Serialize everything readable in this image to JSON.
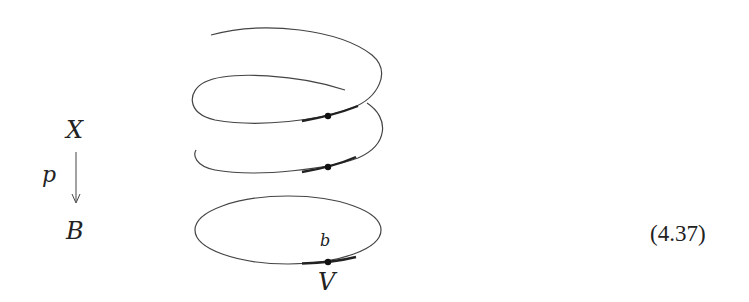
{
  "diagram": {
    "type": "covering-space-helix",
    "labels": {
      "total_space": "X",
      "projection": "p",
      "base_space": "B",
      "basepoint": "b",
      "neighborhood": "V"
    },
    "equation_number": "(4.37)",
    "colors": {
      "stroke": "#444444",
      "highlight": "#222222",
      "text": "#222222"
    },
    "helix_sheets": 2,
    "highlighted_points": 3
  }
}
